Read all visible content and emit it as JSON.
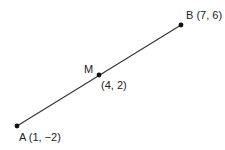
{
  "diagram": {
    "segment": {
      "from": "A",
      "to": "B"
    },
    "points": [
      {
        "id": "A",
        "label": "A (1, −2)",
        "coords": [
          1,
          -2
        ],
        "px": [
          17,
          126
        ]
      },
      {
        "id": "M",
        "label": "M",
        "coord_label": "(4, 2)",
        "coords": [
          4,
          2
        ],
        "px": [
          99,
          75
        ]
      },
      {
        "id": "B",
        "label": "B (7, 6)",
        "coords": [
          7,
          6
        ],
        "px": [
          181,
          25
        ]
      }
    ],
    "colors": {
      "line": "#333333",
      "point": "#111111",
      "text": "#222222"
    }
  }
}
